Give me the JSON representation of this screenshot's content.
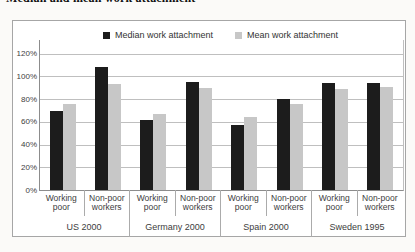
{
  "caption": "Median and mean work attachment",
  "legend": {
    "median_label": "Median work attachment",
    "mean_label": "Mean work attachment"
  },
  "colors": {
    "median_bar": "#1c1c1c",
    "mean_bar": "#c7c7c7",
    "gridline": "#bfbfbf",
    "axis": "#8c8c8c",
    "text": "#3d3d3d"
  },
  "chart_data": {
    "type": "bar",
    "title": "Median and mean work attachment",
    "ylabel": "",
    "xlabel": "",
    "ylim": [
      0,
      120
    ],
    "ytick_step": 20,
    "ytick_labels": [
      "120%",
      "100%",
      "80%",
      "60%",
      "40%",
      "20%",
      "0%"
    ],
    "grid": true,
    "legend_position": "top-center",
    "categories": [
      "Working poor",
      "Non-poor workers",
      "Working poor",
      "Non-poor workers",
      "Working poor",
      "Non-poor workers",
      "Working poor",
      "Non-poor workers"
    ],
    "group_labels": [
      "US 2000",
      "Germany 2000",
      "Spain 2000",
      "Sweden 1995"
    ],
    "series": [
      {
        "name": "Median work attachment",
        "color": "#1c1c1c",
        "values": [
          70,
          108,
          62,
          95,
          57,
          80,
          94,
          94
        ]
      },
      {
        "name": "Mean work attachment",
        "color": "#c7c7c7",
        "values": [
          76,
          93,
          67,
          90,
          64,
          76,
          89,
          91
        ]
      }
    ]
  }
}
